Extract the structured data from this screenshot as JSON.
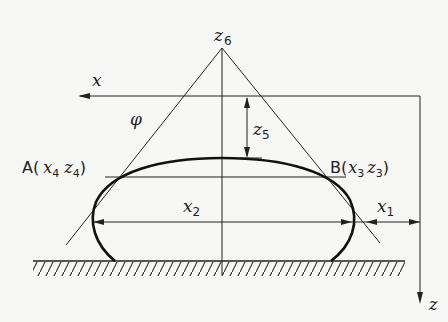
{
  "diagram": {
    "type": "sessile-drop-geometry",
    "labels": {
      "apex": "z",
      "apex_sub": "6",
      "x_axis": "x",
      "z_axis": "z",
      "angle": "φ",
      "z5": "z",
      "z5_sub": "5",
      "x2": "x",
      "x2_sub": "2",
      "x1": "x",
      "x1_sub": "1",
      "pointA_prefix": "A(",
      "pointA_x": "x",
      "pointA_x_sub": "4",
      "pointA_z": "z",
      "pointA_z_sub": "4",
      "pointA_suffix": ")",
      "pointB_prefix": "B(",
      "pointB_x": "x",
      "pointB_x_sub": "3",
      "pointB_z": "z",
      "pointB_z_sub": "3",
      "pointB_suffix": ")"
    },
    "colors": {
      "ink": "#222222",
      "background": "#f7f7f5"
    }
  }
}
